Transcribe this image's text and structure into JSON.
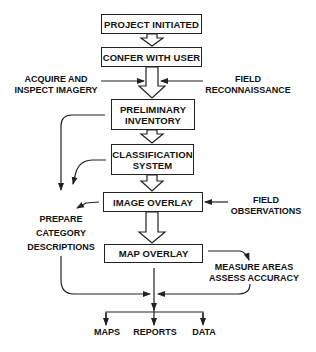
{
  "diagram": {
    "type": "flowchart",
    "boxes": {
      "project_initiated": "PROJECT INITIATED",
      "confer_with_user": "CONFER WITH USER",
      "preliminary_inventory": [
        "PRELIMINARY",
        "INVENTORY"
      ],
      "classification_system": [
        "CLASSIFICATION",
        "SYSTEM"
      ],
      "image_overlay": "IMAGE OVERLAY",
      "map_overlay": "MAP OVERLAY"
    },
    "inputs": {
      "acquire_inspect_imagery": [
        "ACQUIRE AND",
        "INSPECT IMAGERY"
      ],
      "field_reconnaissance": [
        "FIELD",
        "RECONNAISSANCE"
      ],
      "field_observations": [
        "FIELD",
        "OBSERVATIONS"
      ]
    },
    "side_tasks": {
      "prepare_category_descriptions": [
        "PREPARE",
        "CATEGORY",
        "DESCRIPTIONS"
      ],
      "measure_assess": [
        "MEASURE AREAS",
        "ASSESS ACCURACY"
      ]
    },
    "outputs": [
      "MAPS",
      "REPORTS",
      "DATA"
    ],
    "colors": {
      "line": "#222222",
      "background": "#ffffff"
    }
  }
}
